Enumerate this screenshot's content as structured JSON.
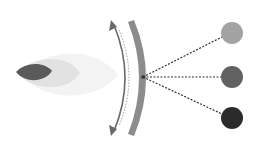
{
  "diagram": {
    "width": 259,
    "height": 155,
    "background": "#ffffff",
    "source_shape": {
      "layers": [
        {
          "name": "outer-glow",
          "color": "#f3f3f3"
        },
        {
          "name": "middle-glow",
          "color": "#e2e2e2"
        },
        {
          "name": "core",
          "color": "#5a5a5a"
        }
      ]
    },
    "curved_band": {
      "color": "#8c8c8c"
    },
    "double_arrow": {
      "color": "#6a6a6a",
      "dotted_color": "#9a9a9a"
    },
    "focal_point": {
      "x": 143,
      "y": 77
    },
    "targets": [
      {
        "name": "target-light",
        "cx": 232,
        "cy": 33,
        "r": 11,
        "color": "#a3a3a3"
      },
      {
        "name": "target-medium",
        "cx": 232,
        "cy": 77,
        "r": 11,
        "color": "#626262"
      },
      {
        "name": "target-dark",
        "cx": 232,
        "cy": 118,
        "r": 11,
        "color": "#2b2b2b"
      }
    ],
    "connector_color": "#333333"
  }
}
